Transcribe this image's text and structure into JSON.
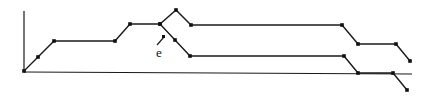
{
  "diagram": {
    "type": "step-path-diagram",
    "annotation_label": "e",
    "stroke_color": "#1a1a1a",
    "upper_path": {
      "name": "upper-branch",
      "points": [
        [
          0,
          0
        ],
        [
          1,
          1
        ],
        [
          2,
          2
        ],
        [
          6,
          2
        ],
        [
          7,
          3
        ],
        [
          9,
          3
        ],
        [
          10,
          4
        ],
        [
          11,
          3
        ],
        [
          21,
          3
        ],
        [
          22,
          2
        ],
        [
          24,
          2
        ],
        [
          25,
          1
        ]
      ]
    },
    "lower_path": {
      "name": "lower-branch",
      "points": [
        [
          9,
          3
        ],
        [
          10,
          2
        ],
        [
          11,
          1
        ],
        [
          21,
          1
        ],
        [
          22,
          0
        ],
        [
          24,
          0
        ],
        [
          25,
          -1
        ]
      ]
    }
  }
}
